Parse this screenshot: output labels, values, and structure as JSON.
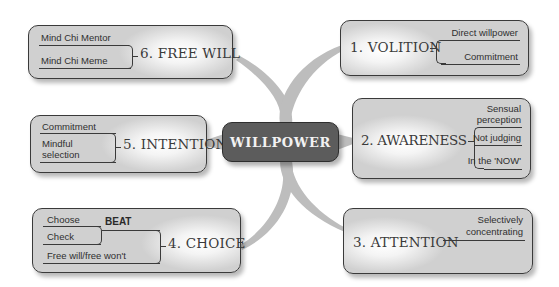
{
  "center": {
    "label": "WILLPOWER"
  },
  "nodes": [
    {
      "id": "volition",
      "title": "1. VOLITION",
      "items": [
        "Direct willpower",
        "Commitment"
      ]
    },
    {
      "id": "awareness",
      "title": "2. AWARENESS",
      "items": [
        "Sensual",
        "perception",
        "Not judging",
        "In the 'NOW'"
      ]
    },
    {
      "id": "attention",
      "title": "3. ATTENTION",
      "items": [
        "Selectively",
        "concentrating"
      ]
    },
    {
      "id": "choice",
      "title": "4. CHOICE",
      "group_label": "BEAT",
      "items": [
        "Choose",
        "Check",
        "Free will/free won't"
      ]
    },
    {
      "id": "intention",
      "title": "5. INTENTION",
      "items": [
        "Commitment",
        "Mindful",
        "selection"
      ]
    },
    {
      "id": "free-will",
      "title": "6. FREE WILL",
      "items": [
        "Mind Chi Mentor",
        "Mind Chi Meme"
      ]
    }
  ],
  "colors": {
    "center_fill": "#5c5c5c",
    "node_fill": "#d0d0d0",
    "arm": "#bdbdbd",
    "outline": "#3a3a3a"
  }
}
